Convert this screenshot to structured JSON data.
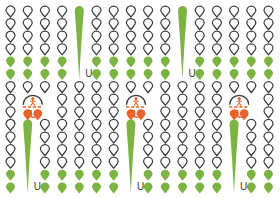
{
  "palette": {
    "background": "#ffffff",
    "pin_outline": "#3a3a3a",
    "pin_green": "#7cb342",
    "pin_green_light": "#8cc14e",
    "motif_orange": "#e8622a",
    "motif_orange_light": "#f07a3c",
    "label_text": "#3c3c3c"
  },
  "grid": {
    "columns": 16,
    "rows": 15,
    "cell_width": 17.2,
    "cell_height": 12.6,
    "origin_x": 6,
    "origin_y": 6,
    "pin_width": 9,
    "pin_height": 11,
    "legend": {
      "outline": "outline-pin",
      "green": "green-pin",
      "blank": "empty-cell"
    },
    "cells": [
      [
        "outline",
        "outline",
        "outline",
        "outline",
        "outline",
        "outline",
        "outline",
        "outline",
        "outline",
        "outline",
        "outline",
        "outline",
        "outline",
        "outline",
        "outline",
        "outline"
      ],
      [
        "outline",
        "outline",
        "outline",
        "outline",
        "outline",
        "outline",
        "outline",
        "outline",
        "outline",
        "outline",
        "outline",
        "outline",
        "outline",
        "outline",
        "outline",
        "outline"
      ],
      [
        "outline",
        "outline",
        "outline",
        "outline",
        "outline",
        "outline",
        "outline",
        "outline",
        "outline",
        "outline",
        "outline",
        "outline",
        "outline",
        "outline",
        "outline",
        "outline"
      ],
      [
        "outline",
        "outline",
        "outline",
        "outline",
        "outline",
        "outline",
        "outline",
        "outline",
        "outline",
        "outline",
        "outline",
        "outline",
        "outline",
        "outline",
        "outline",
        "outline"
      ],
      [
        "green",
        "green",
        "green",
        "green",
        "green",
        "green",
        "green",
        "green",
        "green",
        "green",
        "green",
        "green",
        "green",
        "green",
        "green",
        "green"
      ],
      [
        "green",
        "green",
        "green",
        "green",
        "green",
        "green",
        "green",
        "green",
        "green",
        "green",
        "green",
        "green",
        "green",
        "green",
        "green",
        "green"
      ],
      [
        "outline",
        "outline",
        "outline",
        "outline",
        "outline",
        "outline",
        "outline",
        "outline",
        "outline",
        "outline",
        "outline",
        "outline",
        "outline",
        "outline",
        "outline",
        "outline"
      ],
      [
        "outline",
        "outline",
        "outline",
        "outline",
        "outline",
        "outline",
        "outline",
        "outline",
        "outline",
        "outline",
        "outline",
        "outline",
        "outline",
        "outline",
        "outline",
        "outline"
      ],
      [
        "outline",
        "outline",
        "outline",
        "outline",
        "outline",
        "outline",
        "outline",
        "outline",
        "outline",
        "outline",
        "outline",
        "outline",
        "outline",
        "outline",
        "outline",
        "outline"
      ],
      [
        "outline",
        "outline",
        "outline",
        "outline",
        "outline",
        "outline",
        "outline",
        "outline",
        "outline",
        "outline",
        "outline",
        "outline",
        "outline",
        "outline",
        "outline",
        "outline"
      ],
      [
        "outline",
        "outline",
        "outline",
        "outline",
        "outline",
        "outline",
        "outline",
        "outline",
        "outline",
        "outline",
        "outline",
        "outline",
        "outline",
        "outline",
        "outline",
        "outline"
      ],
      [
        "outline",
        "outline",
        "outline",
        "outline",
        "outline",
        "outline",
        "outline",
        "outline",
        "outline",
        "outline",
        "outline",
        "outline",
        "outline",
        "outline",
        "outline",
        "outline"
      ],
      [
        "outline",
        "outline",
        "outline",
        "outline",
        "outline",
        "outline",
        "outline",
        "outline",
        "outline",
        "outline",
        "outline",
        "outline",
        "outline",
        "outline",
        "outline",
        "outline"
      ],
      [
        "green",
        "green",
        "green",
        "green",
        "green",
        "green",
        "green",
        "green",
        "green",
        "green",
        "green",
        "green",
        "green",
        "green",
        "green",
        "green"
      ],
      [
        "green",
        "green",
        "green",
        "green",
        "green",
        "green",
        "green",
        "green",
        "green",
        "green",
        "green",
        "green",
        "green",
        "green",
        "green",
        "green"
      ]
    ]
  },
  "tall_markers": [
    {
      "id": "tall-pin-1",
      "column": 4,
      "row_start": 0,
      "row_end": 5,
      "label": "U",
      "color": "#7cb342",
      "label_side": "right"
    },
    {
      "id": "tall-pin-2",
      "column": 10,
      "row_start": 0,
      "row_end": 5,
      "label": "U",
      "color": "#7cb342",
      "label_side": "right"
    },
    {
      "id": "tall-pin-3",
      "column": 1,
      "row_start": 9,
      "row_end": 14,
      "label": "U",
      "color": "#7cb342",
      "label_side": "right"
    },
    {
      "id": "tall-pin-4",
      "column": 7,
      "row_start": 9,
      "row_end": 14,
      "label": "U",
      "color": "#7cb342",
      "label_side": "right"
    },
    {
      "id": "tall-pin-5",
      "column": 13,
      "row_start": 9,
      "row_end": 14,
      "label": "U",
      "color": "#7cb342",
      "label_side": "right"
    }
  ],
  "motifs": [
    {
      "id": "motif-1",
      "column": 1,
      "row": 8,
      "label": "U",
      "color": "#e8622a",
      "icon": "umbrella-person-icon"
    },
    {
      "id": "motif-2",
      "column": 7,
      "row": 8,
      "label": "U",
      "color": "#e8622a",
      "icon": "umbrella-person-icon"
    },
    {
      "id": "motif-3",
      "column": 13,
      "row": 8,
      "label": "U",
      "color": "#e8622a",
      "icon": "umbrella-person-icon"
    }
  ]
}
